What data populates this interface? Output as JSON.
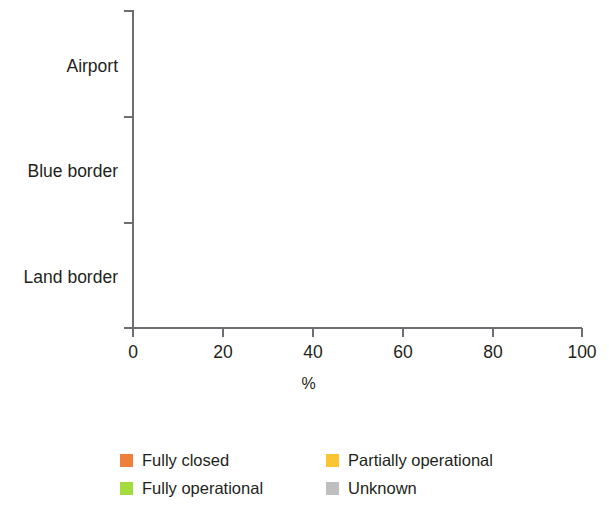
{
  "chart_data": {
    "type": "bar",
    "orientation": "horizontal",
    "stacked": true,
    "normalized": true,
    "title": "",
    "xlabel": "%",
    "ylabel": "",
    "xlim": [
      0,
      100
    ],
    "xticks": [
      0,
      20,
      40,
      60,
      80,
      100
    ],
    "xtick_labels": [
      "0",
      "20",
      "40",
      "60",
      "80",
      "100"
    ],
    "grid": false,
    "legend_position": "bottom-left",
    "categories": [
      "Airport",
      "Blue border",
      "Land border"
    ],
    "series": [
      {
        "name": "Fully closed",
        "color": "#F07F3C",
        "values": [
          5,
          8,
          10
        ]
      },
      {
        "name": "Partially operational",
        "color": "#FBC431",
        "values": [
          12,
          28,
          20
        ]
      },
      {
        "name": "Fully operational",
        "color": "#A3DC3C",
        "values": [
          75,
          57,
          62
        ]
      },
      {
        "name": "Unknown",
        "color": "#BFBFBF",
        "values": [
          8,
          7,
          8
        ]
      }
    ],
    "cumulative_boundaries": {
      "Airport": [
        5,
        17,
        92,
        100
      ],
      "Blue border": [
        8,
        36,
        93,
        100
      ],
      "Land border": [
        10,
        30,
        92,
        100
      ]
    }
  },
  "axis": {
    "x_title": "%",
    "tick_labels": [
      "0",
      "20",
      "40",
      "60",
      "80",
      "100"
    ]
  },
  "categories": [
    {
      "label": "Airport"
    },
    {
      "label": "Blue border"
    },
    {
      "label": "Land border"
    }
  ],
  "legend": {
    "items": [
      {
        "label": "Fully closed",
        "color": "#F07F3C"
      },
      {
        "label": "Partially operational",
        "color": "#FBC431"
      },
      {
        "label": "Fully operational",
        "color": "#A3DC3C"
      },
      {
        "label": "Unknown",
        "color": "#BFBFBF"
      }
    ]
  }
}
